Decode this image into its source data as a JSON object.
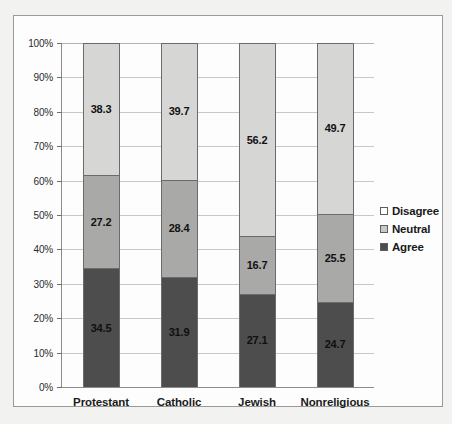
{
  "chart_data": {
    "type": "bar",
    "subtype": "100% stacked column",
    "title": "",
    "xlabel": "",
    "ylabel": "",
    "categories": [
      "Protestant",
      "Catholic",
      "Jewish",
      "Nonreligious"
    ],
    "series": [
      {
        "name": "Agree",
        "color": "#4d4d4d",
        "values": [
          34.5,
          31.9,
          27.1,
          24.7
        ]
      },
      {
        "name": "Neutral",
        "color": "#a9a9a7",
        "values": [
          27.2,
          28.4,
          16.7,
          25.5
        ]
      },
      {
        "name": "Disagree",
        "color": "#d6d6d4",
        "values": [
          38.3,
          39.7,
          56.2,
          49.7
        ]
      }
    ],
    "stack_order_top_to_bottom": [
      "Disagree",
      "Neutral",
      "Agree"
    ],
    "ylim": [
      0,
      100
    ],
    "ytick_labels": [
      "100%",
      "90%",
      "80%",
      "70%",
      "60%",
      "50%",
      "40%",
      "30%",
      "20%",
      "10%",
      "0%"
    ],
    "ytick_values": [
      100,
      90,
      80,
      70,
      60,
      50,
      40,
      30,
      20,
      10,
      0
    ],
    "grid": "horizontal",
    "legend_position": "right",
    "legend_entries": [
      "Disagree",
      "Neutral",
      "Agree"
    ],
    "data_labels": {
      "Protestant": {
        "Disagree": "38.3",
        "Neutral": "27.2",
        "Agree": "34.5"
      },
      "Catholic": {
        "Disagree": "39.7",
        "Neutral": "28.4",
        "Agree": "31.9"
      },
      "Jewish": {
        "Disagree": "56.2",
        "Neutral": "16.7",
        "Agree": "27.1"
      },
      "Nonreligious": {
        "Disagree": "49.7",
        "Neutral": "25.5",
        "Agree": "24.7"
      }
    }
  },
  "colors": {
    "agree": "#4d4d4d",
    "neutral": "#a9a9a7",
    "disagree": "#d6d6d4",
    "gridline": "#c8c8c8",
    "axis": "#8c8c8c",
    "frame": "#9a9a9a"
  }
}
